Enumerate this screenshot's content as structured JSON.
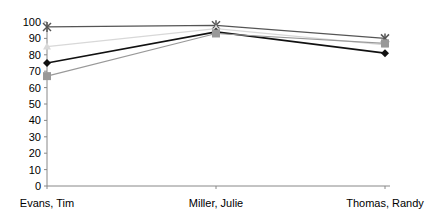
{
  "chart_data": {
    "type": "line",
    "title": "",
    "xlabel": "",
    "ylabel": "",
    "categories": [
      "Evans, Tim",
      "Miller, Julie",
      "Thomas, Randy"
    ],
    "ylim": [
      0,
      100
    ],
    "yticks": [
      0,
      10,
      20,
      30,
      40,
      50,
      60,
      70,
      80,
      90,
      100
    ],
    "grid": false,
    "legend": "none",
    "series": [
      {
        "name": "Series 1",
        "marker": "asterisk",
        "color": "#555555",
        "values": [
          97,
          98,
          90
        ]
      },
      {
        "name": "Series 2",
        "marker": "triangle",
        "color": "#d8d8d8",
        "values": [
          85,
          96,
          86
        ]
      },
      {
        "name": "Series 3",
        "marker": "diamond",
        "color": "#111111",
        "values": [
          75,
          94,
          81
        ]
      },
      {
        "name": "Series 4",
        "marker": "square",
        "color": "#999999",
        "values": [
          67,
          93,
          87
        ]
      }
    ]
  }
}
